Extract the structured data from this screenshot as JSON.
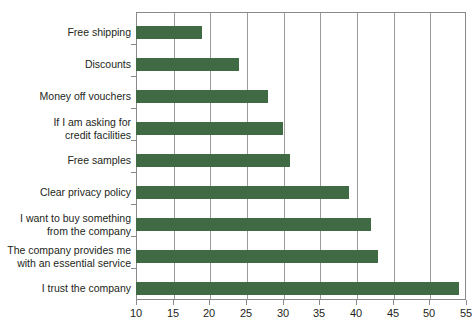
{
  "chart_data": {
    "type": "bar",
    "orientation": "horizontal",
    "title": "",
    "xlabel": "",
    "ylabel": "",
    "xlim": [
      10,
      55
    ],
    "xticks": [
      10,
      15,
      20,
      25,
      30,
      35,
      40,
      45,
      50,
      55
    ],
    "grid": true,
    "legend": false,
    "bar_color": "#3f6a44",
    "axis_color": "#8a8a8a",
    "text_color": "#231f20",
    "categories": [
      "Free shipping",
      "Discounts",
      "Money off vouchers",
      "If I am asking for\ncredit facilities",
      "Free samples",
      "Clear privacy policy",
      "I want to buy something\nfrom the company",
      "The company provides me\nwith an essential service",
      "I trust the company"
    ],
    "values": [
      19,
      24,
      28,
      30,
      31,
      39,
      42,
      43,
      54
    ]
  },
  "axis": {
    "tick_labels": [
      "10",
      "15",
      "20",
      "25",
      "30",
      "35",
      "40",
      "45",
      "50",
      "55"
    ]
  }
}
